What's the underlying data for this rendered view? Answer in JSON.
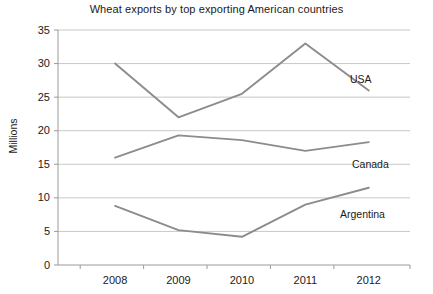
{
  "chart_data": {
    "type": "line",
    "title": "Wheat exports by top exporting American countries",
    "xlabel": "",
    "ylabel": "Millions",
    "x": [
      "2008",
      "2009",
      "2010",
      "2011",
      "2012"
    ],
    "categories": [
      "2008",
      "2009",
      "2010",
      "2011",
      "2012"
    ],
    "ylim": [
      0,
      35
    ],
    "ytick_labels": [
      "35",
      "30",
      "25",
      "20",
      "15",
      "10",
      "5",
      "0"
    ],
    "ytick_values": [
      35,
      30,
      25,
      20,
      15,
      10,
      5,
      0
    ],
    "grid": true,
    "legend_position": "inline-right",
    "series": [
      {
        "name": "USA",
        "values": [
          30,
          22,
          25.5,
          33,
          26
        ],
        "color": "#8c8c8c"
      },
      {
        "name": "Canada",
        "values": [
          16,
          19.3,
          18.6,
          17,
          18.3
        ],
        "color": "#8c8c8c"
      },
      {
        "name": "Argentina",
        "values": [
          8.8,
          5.2,
          4.2,
          9,
          11.5
        ],
        "color": "#8c8c8c"
      }
    ],
    "series_labels": [
      {
        "name": "USA",
        "x": 350,
        "y": 73
      },
      {
        "name": "Canada",
        "x": 352,
        "y": 158
      },
      {
        "name": "Argentina",
        "x": 340,
        "y": 208
      }
    ]
  },
  "colors": {
    "line": "#8c8c8c",
    "grid": "#c8c8c8",
    "axis": "#9a9a9a",
    "text": "#1a1a1a",
    "background": "#ffffff"
  }
}
